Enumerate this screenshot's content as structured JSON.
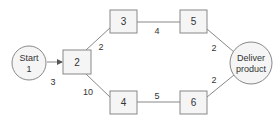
{
  "diagram": {
    "type": "network",
    "nodes": [
      {
        "id": "start",
        "label_line1": "Start",
        "label_line2": "1",
        "shape": "circle"
      },
      {
        "id": "n2",
        "label": "2",
        "shape": "box"
      },
      {
        "id": "n3",
        "label": "3",
        "shape": "box"
      },
      {
        "id": "n4",
        "label": "4",
        "shape": "box"
      },
      {
        "id": "n5",
        "label": "5",
        "shape": "box"
      },
      {
        "id": "n6",
        "label": "6",
        "shape": "box"
      },
      {
        "id": "deliver",
        "label_line1": "Deliver",
        "label_line2": "product",
        "shape": "circle"
      }
    ],
    "edges": [
      {
        "from": "start",
        "to": "n2",
        "weight": "3"
      },
      {
        "from": "n2",
        "to": "n3",
        "weight": "2"
      },
      {
        "from": "n2",
        "to": "n4",
        "weight": "10"
      },
      {
        "from": "n3",
        "to": "n5",
        "weight": "4"
      },
      {
        "from": "n4",
        "to": "n6",
        "weight": "5"
      },
      {
        "from": "n5",
        "to": "deliver",
        "weight": "2"
      },
      {
        "from": "n6",
        "to": "deliver",
        "weight": "2"
      }
    ],
    "colors": {
      "stroke": "#777777",
      "fill": "#f5f5f5",
      "text": "#333333"
    }
  }
}
